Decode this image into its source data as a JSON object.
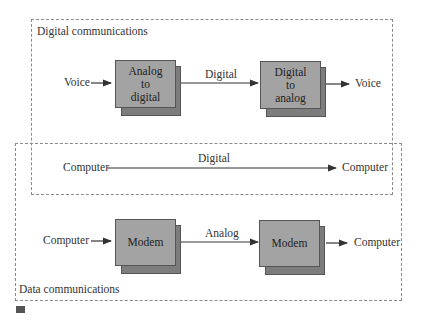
{
  "figure": {
    "regions": {
      "digital": {
        "label": "Digital communications"
      },
      "data": {
        "label": "Data communications"
      }
    },
    "row1": {
      "input": "Voice",
      "box1": {
        "lines": [
          "Analog",
          "to",
          "digital"
        ]
      },
      "link_label": "Digital",
      "box2": {
        "lines": [
          "Digital",
          "to",
          "analog"
        ]
      },
      "output": "Voice"
    },
    "row2": {
      "input": "Computer",
      "link_label": "Digital",
      "output": "Computer"
    },
    "row3": {
      "input": "Computer",
      "box1": {
        "label": "Modem"
      },
      "link_label": "Analog",
      "box2": {
        "label": "Modem"
      },
      "output": "Computer"
    },
    "colors": {
      "box_face": "#a3a3a3",
      "box_side": "#7d7d7d",
      "dash_border": "#8a8a8a",
      "line": "#333333"
    }
  }
}
